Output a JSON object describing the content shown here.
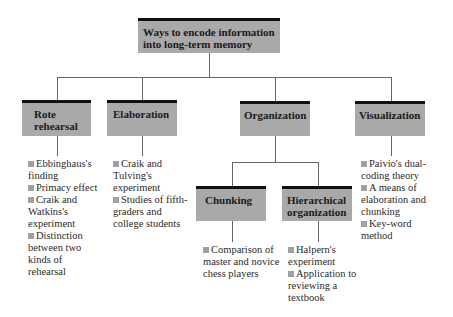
{
  "root": {
    "label_line1": "Ways to encode information",
    "label_line2": "into long-term memory"
  },
  "categories": [
    {
      "label_line1": "Rote",
      "label_line2": "rehearsal",
      "items": [
        "Ebbinghaus's finding",
        "Primacy effect",
        "Craik and Watkins's experiment",
        "Distinction between two kinds of rehearsal"
      ]
    },
    {
      "label_line1": "Elaboration",
      "label_line2": "",
      "items": [
        "Craik and Tulving's experiment",
        "Studies of fifth-graders and college students"
      ]
    },
    {
      "label_line1": "Organization",
      "label_line2": "",
      "children": [
        {
          "label_line1": "Chunking",
          "label_line2": "",
          "items": [
            "Comparison of master and novice chess players"
          ]
        },
        {
          "label_line1": "Hierarchical",
          "label_line2": "organization",
          "items": [
            "Halpern's experiment",
            "Application to reviewing a textbook"
          ]
        }
      ]
    },
    {
      "label_line1": "Visualization",
      "label_line2": "",
      "items": [
        "Paivio's dual-coding theory",
        "A means of elaboration and chunking",
        "Key-word method"
      ]
    }
  ],
  "colors": {
    "box_fill": "#a9a9a9",
    "box_top_border": "#111111",
    "bullet": "#a0a0a0",
    "connector": "#666666"
  }
}
